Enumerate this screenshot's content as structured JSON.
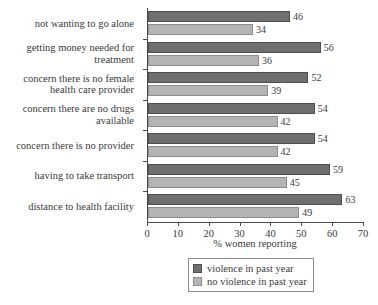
{
  "chart_data": {
    "type": "bar",
    "orientation": "horizontal",
    "title": "",
    "xlabel": "% women reporting",
    "ylabel": "",
    "xlim": [
      0,
      70
    ],
    "xticks": [
      0,
      10,
      20,
      30,
      40,
      50,
      60,
      70
    ],
    "grid": false,
    "legend_position": "bottom-right",
    "categories": [
      "not wanting to go alone",
      "getting money needed for treatment",
      "concern there is no female health care provider",
      "concern there are no drugs available",
      "concern there is no provider",
      "having to take transport",
      "distance to health facility"
    ],
    "category_lines": [
      [
        "not wanting to go alone"
      ],
      [
        "getting money needed for",
        "treatment"
      ],
      [
        "concern there is no female",
        "health care provider"
      ],
      [
        "concern there are no drugs",
        "available"
      ],
      [
        "concern there is no provider"
      ],
      [
        "having to take transport"
      ],
      [
        "distance to health facility"
      ]
    ],
    "series": [
      {
        "name": "violence in past year",
        "color": "#6f6f6f",
        "values": [
          46,
          56,
          52,
          54,
          54,
          59,
          63
        ]
      },
      {
        "name": "no violence in past year",
        "color": "#b4b4b4",
        "values": [
          34,
          36,
          39,
          42,
          42,
          45,
          49
        ]
      }
    ]
  },
  "axis": {
    "tick_labels": [
      "0",
      "10",
      "20",
      "30",
      "40",
      "50",
      "60",
      "70"
    ],
    "title": "% women reporting"
  },
  "legend": {
    "entries": [
      {
        "label": "violence in past year",
        "color": "#6f6f6f"
      },
      {
        "label": "no violence in past year",
        "color": "#b4b4b4"
      }
    ]
  }
}
